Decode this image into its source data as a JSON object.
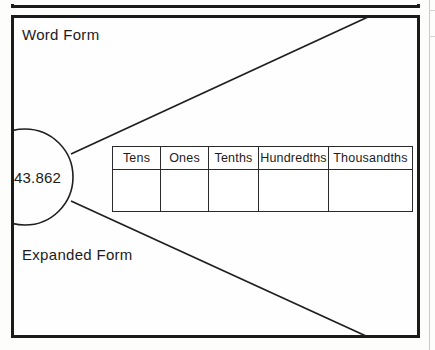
{
  "worksheet": {
    "number_value": "43.862",
    "labels": {
      "word_form": "Word Form",
      "expanded_form": "Expanded Form"
    },
    "place_value_table": {
      "headers": [
        "Tens",
        "Ones",
        "Tenths",
        "Hundredths",
        "Thousandths"
      ],
      "rows": [
        [
          "",
          "",
          "",
          "",
          ""
        ]
      ]
    }
  },
  "colors": {
    "ink": "#1b1b1b",
    "page": "#fdfdfc",
    "table_line": "#2a2a2a"
  }
}
